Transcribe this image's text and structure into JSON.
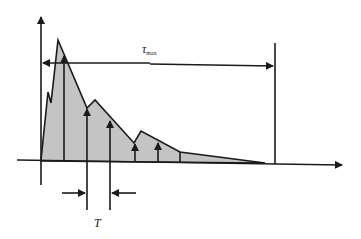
{
  "diagram": {
    "title": "",
    "labels": {
      "tau_max": "τ",
      "tau_max_sub": "max",
      "period": "T"
    },
    "colors": {
      "fill": "#c4c4c4",
      "stroke": "#1a1a1a",
      "background": "#ffffff"
    },
    "envelope_points": [
      [
        41,
        160
      ],
      [
        48,
        92
      ],
      [
        51,
        103
      ],
      [
        58,
        40
      ],
      [
        87,
        108
      ],
      [
        95,
        100
      ],
      [
        134,
        143
      ],
      [
        141,
        131
      ],
      [
        180,
        152
      ],
      [
        265,
        163
      ]
    ],
    "impulse_arrows": [
      {
        "x": 64,
        "top": 56
      },
      {
        "x": 87,
        "top": 109
      },
      {
        "x": 110,
        "top": 121
      },
      {
        "x": 135,
        "top": 144
      },
      {
        "x": 158,
        "top": 143
      }
    ],
    "extra_lines": [
      {
        "x": 180,
        "top": 152
      }
    ],
    "tau_max_span": {
      "x1": 41,
      "x2": 275,
      "y": 63
    },
    "period_span": {
      "x1": 87,
      "x2": 110,
      "y": 193
    }
  }
}
